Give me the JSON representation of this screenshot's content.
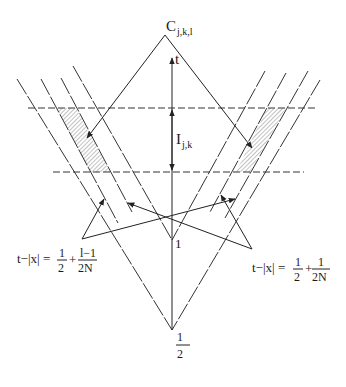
{
  "figure": {
    "apex_label": "C",
    "apex_subscript": "j,k,l",
    "axis_label": "t",
    "interval_label": "I",
    "interval_subscript": "j,k",
    "point_one_label": "1",
    "point_half_numerator": "1",
    "point_half_denominator": "2",
    "left_equation": {
      "lhs": "t−|x| = ",
      "frac1_num": "1",
      "frac1_den": "2",
      "plus": "+",
      "frac2_num": "l−1",
      "frac2_den": "2N"
    },
    "right_equation": {
      "lhs": "t−|x| = ",
      "frac1_num": "1",
      "frac1_den": "2",
      "plus": "+",
      "frac2_num": "1",
      "frac2_den": "2N"
    },
    "colors": {
      "line": "#222222",
      "background": "#ffffff",
      "hatch": "#555555"
    }
  }
}
